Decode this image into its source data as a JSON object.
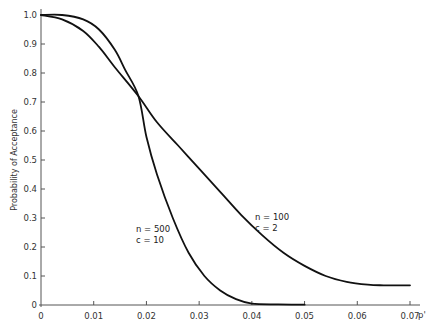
{
  "chart_data": {
    "type": "line",
    "title": "",
    "xlabel": "p'",
    "ylabel": "Probability of Acceptance",
    "xlim": [
      0,
      0.07
    ],
    "ylim": [
      0,
      1.0
    ],
    "grid": false,
    "legend_position": "inline annotations",
    "x_ticks": [
      "0",
      "0.01",
      "0.02",
      "0.03",
      "0.04",
      "0.05",
      "0.06",
      "0.07"
    ],
    "y_ticks": [
      "0",
      "0.1",
      "0.2",
      "0.3",
      "0.4",
      "0.5",
      "0.6",
      "0.7",
      "0.8",
      "0.9",
      "1.0"
    ],
    "series": [
      {
        "name": "n = 500, c = 10",
        "label_lines": [
          "n = 500",
          "c =   10"
        ],
        "x": [
          0,
          0.004,
          0.008,
          0.011,
          0.014,
          0.016,
          0.0185,
          0.02,
          0.022,
          0.025,
          0.028,
          0.031,
          0.034,
          0.037,
          0.04,
          0.045,
          0.05
        ],
        "values": [
          1.0,
          1.0,
          0.985,
          0.95,
          0.88,
          0.81,
          0.72,
          0.58,
          0.45,
          0.3,
          0.18,
          0.1,
          0.05,
          0.02,
          0.005,
          0.002,
          0.001
        ]
      },
      {
        "name": "n = 100, c = 2",
        "label_lines": [
          "n = 100",
          "c =     2"
        ],
        "x": [
          0,
          0.004,
          0.008,
          0.011,
          0.014,
          0.0185,
          0.022,
          0.026,
          0.03,
          0.034,
          0.038,
          0.042,
          0.046,
          0.05,
          0.054,
          0.058,
          0.062,
          0.065,
          0.07
        ],
        "values": [
          1.0,
          0.985,
          0.945,
          0.89,
          0.82,
          0.72,
          0.63,
          0.55,
          0.47,
          0.39,
          0.31,
          0.24,
          0.18,
          0.135,
          0.1,
          0.08,
          0.07,
          0.068,
          0.068
        ]
      }
    ]
  }
}
